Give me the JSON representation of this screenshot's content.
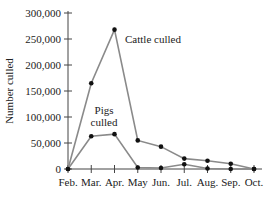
{
  "chart_data": {
    "type": "line",
    "title": "",
    "xlabel": "",
    "ylabel": "Number culled",
    "categories": [
      "Feb.",
      "Mar.",
      "Apr.",
      "May",
      "Jun.",
      "Jul.",
      "Aug.",
      "Sep.",
      "Oct."
    ],
    "series": [
      {
        "name": "Cattle culled",
        "values": [
          0,
          165000,
          268000,
          55000,
          43000,
          20000,
          16000,
          10000,
          0
        ]
      },
      {
        "name": "Pigs culled",
        "values": [
          0,
          63000,
          67000,
          3000,
          2000,
          9000,
          1000,
          0,
          0
        ]
      }
    ],
    "ylim": [
      0,
      300000
    ],
    "yticks": [
      0,
      50000,
      100000,
      150000,
      200000,
      250000,
      300000
    ],
    "ytick_labels": [
      "0",
      "50,000",
      "100,000",
      "150,000",
      "200,000",
      "250,000",
      "300,000"
    ],
    "annotations": [
      {
        "text": "Cattle culled",
        "near": "Apr."
      },
      {
        "text": "Pigs",
        "near": "Mar.-Apr."
      },
      {
        "text": "culled",
        "near": "Mar.-Apr."
      }
    ],
    "grid": false,
    "legend": "inline annotations"
  },
  "colors": {
    "line": "#8a8a8a",
    "marker": "#111111",
    "axis": "#444444",
    "text": "#222222"
  }
}
